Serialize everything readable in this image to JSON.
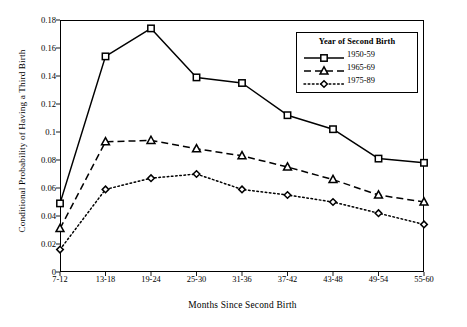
{
  "chart_data": {
    "type": "line",
    "title": "",
    "xlabel": "Months Since Second Birth",
    "ylabel": "Conditional Probability of Having a Third Birth",
    "categories": [
      "7-12",
      "13-18",
      "19-24",
      "25-30",
      "31-36",
      "37-42",
      "43-48",
      "49-54",
      "55-60"
    ],
    "ylim": [
      0,
      0.18
    ],
    "yticks": [
      "0",
      "0.02",
      "0.04",
      "0.06",
      "0.08",
      "0.1",
      "0.12",
      "0.14",
      "0.16",
      "0.18"
    ],
    "ytick_values": [
      0,
      0.02,
      0.04,
      0.06,
      0.08,
      0.1,
      0.12,
      0.14,
      0.16,
      0.18
    ],
    "grid": false,
    "legend_position": "top-right",
    "legend_title": "Year of Second Birth",
    "series": [
      {
        "name": "1950-59",
        "marker": "square",
        "linestyle": "solid",
        "color": "#000000",
        "values": [
          0.049,
          0.154,
          0.174,
          0.139,
          0.135,
          0.112,
          0.102,
          0.081,
          0.078
        ]
      },
      {
        "name": "1965-69",
        "marker": "triangle",
        "linestyle": "dashed",
        "color": "#000000",
        "values": [
          0.031,
          0.093,
          0.094,
          0.088,
          0.083,
          0.075,
          0.066,
          0.055,
          0.05
        ]
      },
      {
        "name": "1975-89",
        "marker": "diamond",
        "linestyle": "dotted",
        "color": "#000000",
        "values": [
          0.016,
          0.059,
          0.067,
          0.07,
          0.059,
          0.055,
          0.05,
          0.042,
          0.034
        ]
      }
    ]
  }
}
